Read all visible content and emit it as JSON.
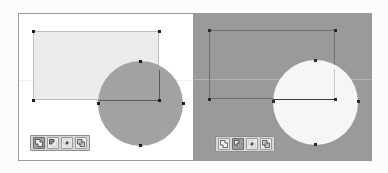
{
  "app": {
    "title": "Shape Boolean Operations Comparison",
    "background_color": "#fcfcfc"
  },
  "panels": [
    {
      "id": "before",
      "name": "Overlapping shapes (before boolean operation)",
      "canvas_background": "#ffffff",
      "border_color": "#9c9c9c",
      "shapes": [
        {
          "name": "rectangle",
          "type": "rect",
          "fill": "#ececec",
          "stroke": "#bdbdbd",
          "x": 14,
          "y": 17,
          "width": 126,
          "height": 69,
          "selected": true
        },
        {
          "name": "circle",
          "type": "ellipse",
          "fill": "#a2a2a2",
          "stroke": "none",
          "x": 79,
          "y": 47,
          "width": 85,
          "height": 85,
          "selected": true
        }
      ],
      "handle_color": "#1d1d1d",
      "handle_count": 8,
      "toolbar": {
        "name": "boolean-operations-toolbar",
        "active_index": 0,
        "buttons": [
          {
            "icon": "union-icon",
            "label": "Unite",
            "active": true
          },
          {
            "icon": "subtract-icon",
            "label": "Subtract",
            "active": false
          },
          {
            "icon": "intersect-icon",
            "label": "Intersect",
            "active": false
          },
          {
            "icon": "exclude-icon",
            "label": "Exclude",
            "active": false
          }
        ]
      }
    },
    {
      "id": "after",
      "name": "Boolean result (after operation applied)",
      "canvas_background": "#9a9a9a",
      "border_color": "#9a9a9a",
      "shapes": [
        {
          "name": "rectangle",
          "type": "rect",
          "fill": "transparent",
          "stroke": "#6f6f6f",
          "x": 15,
          "y": 17,
          "width": 126,
          "height": 69,
          "selected": true
        },
        {
          "name": "circle",
          "type": "ellipse",
          "fill": "#f6f6f6",
          "stroke": "none",
          "x": 79,
          "y": 47,
          "width": 85,
          "height": 85,
          "selected": true
        }
      ],
      "handle_color": "#2a2a2a",
      "handle_count": 8,
      "toolbar": {
        "name": "boolean-operations-toolbar",
        "active_index": 1,
        "buttons": [
          {
            "icon": "union-icon",
            "label": "Unite",
            "active": false
          },
          {
            "icon": "subtract-icon",
            "label": "Subtract",
            "active": true
          },
          {
            "icon": "intersect-icon",
            "label": "Intersect",
            "active": false
          },
          {
            "icon": "exclude-icon",
            "label": "Exclude",
            "active": false
          }
        ]
      }
    }
  ]
}
